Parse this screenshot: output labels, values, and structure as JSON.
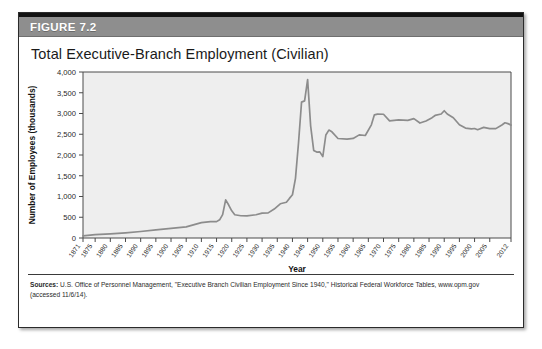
{
  "figure": {
    "label": "FIGURE 7.2",
    "title": "Total Executive-Branch Employment (Civilian)",
    "header_color": "#8e8e8e",
    "series_color": "#8c8c8c",
    "plot_bg_color": "#eeeeee"
  },
  "sources": {
    "prefix": "Sources:",
    "text": " U.S. Office of Personnel Management, \"Executive Branch Civilian Employment Since 1940,\" Historical Federal Workforce Tables, www.opm.gov (accessed 11/6/14)."
  },
  "chart_data": {
    "type": "line",
    "title": "Total Executive-Branch Employment (Civilian)",
    "xlabel": "Year",
    "ylabel": "Number of Employees (thousands)",
    "xlim": [
      1871,
      2012
    ],
    "ylim": [
      0,
      4000
    ],
    "grid": false,
    "legend": "none",
    "ytick_values": [
      0,
      500,
      1000,
      1500,
      2000,
      2500,
      3000,
      3500,
      4000
    ],
    "ytick_labels": [
      "0",
      "500",
      "1,000",
      "1,500",
      "2,000",
      "2,500",
      "3,000",
      "3,500",
      "4,000"
    ],
    "xtick_values": [
      1871,
      1875,
      1880,
      1885,
      1890,
      1895,
      1900,
      1905,
      1910,
      1915,
      1920,
      1925,
      1930,
      1935,
      1940,
      1945,
      1950,
      1955,
      1960,
      1965,
      1970,
      1975,
      1980,
      1985,
      1990,
      1995,
      2000,
      2005,
      2012
    ],
    "xtick_labels": [
      "1871",
      "1875",
      "1880",
      "1885",
      "1890",
      "1895",
      "1900",
      "1905",
      "1910",
      "1915",
      "1920",
      "1925",
      "1930",
      "1935",
      "1940",
      "1945",
      "1950",
      "1955",
      "1960",
      "1965",
      "1970",
      "1975",
      "1980",
      "1985",
      "1990",
      "1995",
      "2000",
      "2005",
      "2012"
    ],
    "series": [
      {
        "name": "Total executive-branch civilian employment",
        "color": "#8c8c8c",
        "x": [
          1871,
          1875,
          1880,
          1885,
          1890,
          1895,
          1900,
          1905,
          1910,
          1913,
          1915,
          1916,
          1917,
          1918,
          1919,
          1920,
          1921,
          1923,
          1925,
          1928,
          1930,
          1932,
          1934,
          1936,
          1938,
          1939,
          1940,
          1941,
          1942,
          1943,
          1944,
          1945,
          1946,
          1947,
          1948,
          1949,
          1950,
          1951,
          1952,
          1953,
          1955,
          1958,
          1960,
          1962,
          1964,
          1966,
          1967,
          1968,
          1970,
          1972,
          1975,
          1978,
          1980,
          1982,
          1984,
          1986,
          1987,
          1989,
          1990,
          1991,
          1993,
          1995,
          1997,
          1999,
          2000,
          2001,
          2003,
          2005,
          2007,
          2009,
          2010,
          2011,
          2012
        ],
        "y": [
          51,
          80,
          100,
          125,
          157,
          196,
          231,
          268,
          372,
          396,
          395,
          438,
          563,
          917,
          794,
          655,
          561,
          536,
          533,
          560,
          601,
          605,
          698,
          824,
          861,
          954,
          1042,
          1438,
          2296,
          3274,
          3304,
          3816,
          2696,
          2111,
          2071,
          2075,
          1961,
          2482,
          2600,
          2558,
          2397,
          2382,
          2399,
          2485,
          2470,
          2726,
          2968,
          2985,
          2982,
          2823,
          2848,
          2833,
          2876,
          2770,
          2818,
          2899,
          2953,
          2988,
          3067,
          2988,
          2899,
          2729,
          2649,
          2629,
          2639,
          2610,
          2666,
          2635,
          2636,
          2724,
          2776,
          2756,
          2720
        ]
      }
    ]
  }
}
